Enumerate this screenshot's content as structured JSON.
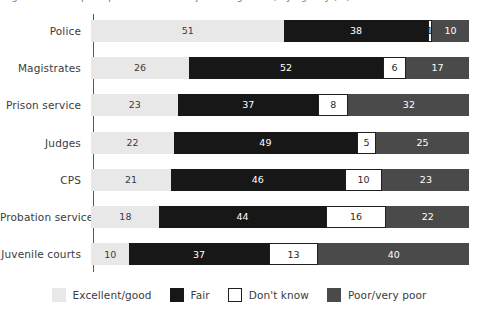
{
  "title_strip": "Figure 1: Public perceptions of criminal justice agencies, by agency (%)",
  "chart_data": {
    "type": "bar",
    "orientation": "horizontal",
    "stacked": true,
    "stack_mode": "percent",
    "title": "",
    "xlabel": "",
    "ylabel": "",
    "xlim": [
      0,
      100
    ],
    "grid": false,
    "legend_position": "bottom",
    "categories": [
      "Police",
      "Magistrates",
      "Prison service",
      "Judges",
      "CPS",
      "Probation service",
      "Juvenile courts"
    ],
    "series": [
      {
        "name": "Excellent/good",
        "color": "#e8e8e8",
        "values": [
          51,
          26,
          23,
          22,
          21,
          18,
          10
        ]
      },
      {
        "name": "Fair",
        "color": "#171717",
        "values": [
          38,
          52,
          37,
          49,
          46,
          44,
          37
        ]
      },
      {
        "name": "Don't know",
        "color": "#ffffff",
        "values": [
          1,
          6,
          8,
          5,
          10,
          16,
          13
        ]
      },
      {
        "name": "Poor/very poor",
        "color": "#4a4a4a",
        "values": [
          10,
          17,
          32,
          25,
          23,
          22,
          40
        ]
      }
    ]
  },
  "rows": [
    {
      "label": "Police",
      "segments": [
        {
          "series": "Excellent/good",
          "value": "51"
        },
        {
          "series": "Fair",
          "value": "38"
        },
        {
          "series": "Don't know",
          "value": "1"
        },
        {
          "series": "Poor/very poor",
          "value": "10"
        }
      ]
    },
    {
      "label": "Magistrates",
      "segments": [
        {
          "series": "Excellent/good",
          "value": "26"
        },
        {
          "series": "Fair",
          "value": "52"
        },
        {
          "series": "Don't know",
          "value": "6"
        },
        {
          "series": "Poor/very poor",
          "value": "17"
        }
      ]
    },
    {
      "label": "Prison service",
      "segments": [
        {
          "series": "Excellent/good",
          "value": "23"
        },
        {
          "series": "Fair",
          "value": "37"
        },
        {
          "series": "Don't know",
          "value": "8"
        },
        {
          "series": "Poor/very poor",
          "value": "32"
        }
      ]
    },
    {
      "label": "Judges",
      "segments": [
        {
          "series": "Excellent/good",
          "value": "22"
        },
        {
          "series": "Fair",
          "value": "49"
        },
        {
          "series": "Don't know",
          "value": "5"
        },
        {
          "series": "Poor/very poor",
          "value": "25"
        }
      ]
    },
    {
      "label": "CPS",
      "segments": [
        {
          "series": "Excellent/good",
          "value": "21"
        },
        {
          "series": "Fair",
          "value": "46"
        },
        {
          "series": "Don't know",
          "value": "10"
        },
        {
          "series": "Poor/very poor",
          "value": "23"
        }
      ]
    },
    {
      "label": "Probation service",
      "segments": [
        {
          "series": "Excellent/good",
          "value": "18"
        },
        {
          "series": "Fair",
          "value": "44"
        },
        {
          "series": "Don't know",
          "value": "16"
        },
        {
          "series": "Poor/very poor",
          "value": "22"
        }
      ]
    },
    {
      "label": "Juvenile courts",
      "segments": [
        {
          "series": "Excellent/good",
          "value": "10"
        },
        {
          "series": "Fair",
          "value": "37"
        },
        {
          "series": "Don't know",
          "value": "13"
        },
        {
          "series": "Poor/very poor",
          "value": "40"
        }
      ]
    }
  ],
  "legend": {
    "items": [
      {
        "label": "Excellent/good",
        "color": "#e8e8e8"
      },
      {
        "label": "Fair",
        "color": "#171717"
      },
      {
        "label": "Don't know",
        "color": "#ffffff"
      },
      {
        "label": "Poor/very poor",
        "color": "#4a4a4a"
      }
    ]
  },
  "colors": {
    "excellent_good": "#e8e8e8",
    "fair": "#171717",
    "dont_know": "#ffffff",
    "poor_very_poor": "#4a4a4a",
    "axis": "#58585f",
    "text": "#3b3b40"
  }
}
